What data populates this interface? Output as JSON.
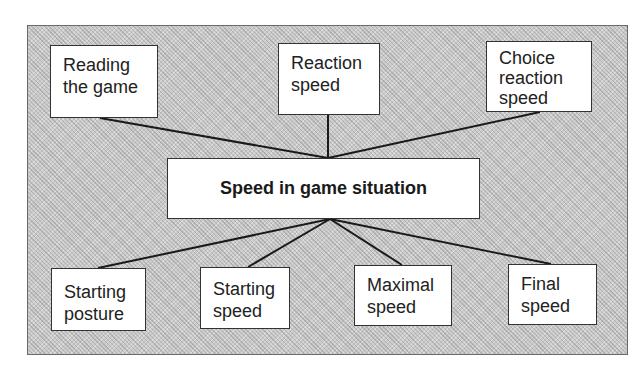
{
  "diagram": {
    "center": {
      "label": "Speed in game situation"
    },
    "top_nodes": [
      {
        "label": "Reading\nthe game"
      },
      {
        "label": "Reaction\nspeed"
      },
      {
        "label": "Choice\nreaction\nspeed"
      }
    ],
    "bottom_nodes": [
      {
        "label": "Starting\nposture"
      },
      {
        "label": "Starting\nspeed"
      },
      {
        "label": "Maximal\nspeed"
      },
      {
        "label": "Final\nspeed"
      }
    ],
    "colors": {
      "panel_fill": "#c9c9c9",
      "box_fill": "#ffffff",
      "line": "#1a1a1a"
    }
  }
}
